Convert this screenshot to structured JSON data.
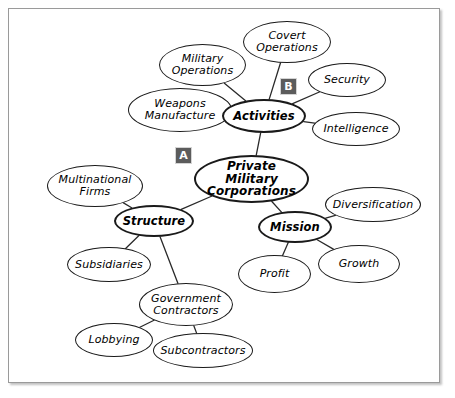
{
  "diagram": {
    "type": "concept-map",
    "background_color": "#ffffff",
    "node_border_color": "#1a1a1a",
    "edge_color": "#2a2a2a",
    "marker_color": "#5c5c5c",
    "center": {
      "id": "center",
      "label": "Private Military\nCorporations",
      "x": 194,
      "y": 155,
      "w": 115,
      "h": 48
    },
    "hubs": [
      {
        "id": "activities",
        "label": "Activities",
        "x": 222,
        "y": 99,
        "w": 84,
        "h": 34
      },
      {
        "id": "structure",
        "label": "Structure",
        "x": 114,
        "y": 205,
        "w": 80,
        "h": 32
      },
      {
        "id": "mission",
        "label": "Mission",
        "x": 258,
        "y": 211,
        "w": 74,
        "h": 32
      }
    ],
    "leaves": [
      {
        "id": "covert-operations",
        "label": "Covert\nOperations",
        "x": 243,
        "y": 21,
        "w": 88,
        "h": 42
      },
      {
        "id": "military-operations",
        "label": "Military\nOperations",
        "x": 159,
        "y": 44,
        "w": 87,
        "h": 42
      },
      {
        "id": "weapons-manufacture",
        "label": "Weapons\nManufacture",
        "x": 128,
        "y": 88,
        "w": 104,
        "h": 44
      },
      {
        "id": "security",
        "label": "Security",
        "x": 308,
        "y": 63,
        "w": 78,
        "h": 34
      },
      {
        "id": "intelligence",
        "label": "Intelligence",
        "x": 312,
        "y": 112,
        "w": 88,
        "h": 34
      },
      {
        "id": "multinational-firms",
        "label": "Multinational\nFirms",
        "x": 47,
        "y": 165,
        "w": 96,
        "h": 42
      },
      {
        "id": "subsidiaries",
        "label": "Subsidiaries",
        "x": 67,
        "y": 247,
        "w": 84,
        "h": 35
      },
      {
        "id": "government-contractors",
        "label": "Government\nContractors",
        "x": 139,
        "y": 283,
        "w": 94,
        "h": 43
      },
      {
        "id": "lobbying",
        "label": "Lobbying",
        "x": 75,
        "y": 323,
        "w": 78,
        "h": 34
      },
      {
        "id": "subcontractors",
        "label": "Subcontractors",
        "x": 153,
        "y": 333,
        "w": 100,
        "h": 35
      },
      {
        "id": "diversification",
        "label": "Diversification",
        "x": 325,
        "y": 187,
        "w": 96,
        "h": 35
      },
      {
        "id": "growth",
        "label": "Growth",
        "x": 318,
        "y": 245,
        "w": 82,
        "h": 38
      },
      {
        "id": "profit",
        "label": "Profit",
        "x": 238,
        "y": 255,
        "w": 73,
        "h": 38
      }
    ],
    "markers": [
      {
        "id": "marker-a",
        "label": "A",
        "x": 175,
        "y": 147
      },
      {
        "id": "marker-b",
        "label": "B",
        "x": 280,
        "y": 78
      }
    ],
    "edges": [
      {
        "from": "center",
        "to": "activities"
      },
      {
        "from": "center",
        "to": "structure"
      },
      {
        "from": "center",
        "to": "mission"
      },
      {
        "from": "activities",
        "to": "covert-operations"
      },
      {
        "from": "activities",
        "to": "military-operations"
      },
      {
        "from": "activities",
        "to": "weapons-manufacture"
      },
      {
        "from": "activities",
        "to": "security"
      },
      {
        "from": "activities",
        "to": "intelligence"
      },
      {
        "from": "structure",
        "to": "multinational-firms"
      },
      {
        "from": "structure",
        "to": "subsidiaries"
      },
      {
        "from": "structure",
        "to": "government-contractors"
      },
      {
        "from": "government-contractors",
        "to": "lobbying"
      },
      {
        "from": "government-contractors",
        "to": "subcontractors"
      },
      {
        "from": "mission",
        "to": "diversification"
      },
      {
        "from": "mission",
        "to": "growth"
      },
      {
        "from": "mission",
        "to": "profit"
      }
    ]
  }
}
